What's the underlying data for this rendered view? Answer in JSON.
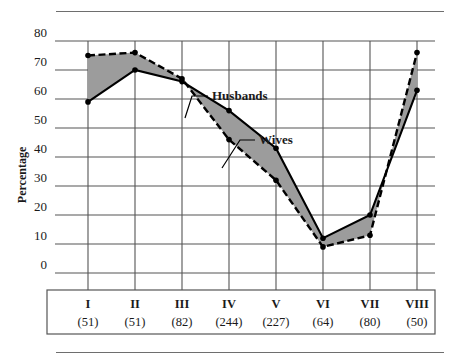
{
  "chart_data": {
    "type": "line",
    "title": "",
    "xlabel": "",
    "ylabel": "Percentage",
    "ylim": [
      0,
      80
    ],
    "ytick_step": 10,
    "yticks": [
      0,
      10,
      20,
      30,
      40,
      50,
      60,
      70,
      80
    ],
    "grid": true,
    "legend_position": "inline-annotations",
    "categories": [
      "I",
      "II",
      "III",
      "IV",
      "V",
      "VI",
      "VII",
      "VIII"
    ],
    "category_counts": [
      "(51)",
      "(51)",
      "(82)",
      "(244)",
      "(227)",
      "(64)",
      "(80)",
      "(50)"
    ],
    "series": [
      {
        "name": "Husbands",
        "style": "dashed",
        "values": [
          75,
          76,
          67,
          46,
          32,
          9,
          13,
          76
        ]
      },
      {
        "name": "Wives",
        "style": "solid",
        "values": [
          59,
          70,
          66,
          56,
          43,
          12,
          20,
          63
        ]
      }
    ],
    "band_fill": "#9c9c9c",
    "annotations": [
      {
        "text": "Husbands",
        "target_category": "III"
      },
      {
        "text": "Wives",
        "target_category": "IV"
      }
    ]
  },
  "axes": {
    "y_title": "Percentage",
    "y_tick_labels": [
      "80",
      "70",
      "60",
      "50",
      "40",
      "30",
      "20",
      "10",
      "0"
    ],
    "x_categories": [
      {
        "label": "I",
        "count": "(51)"
      },
      {
        "label": "II",
        "count": "(51)"
      },
      {
        "label": "III",
        "count": "(82)"
      },
      {
        "label": "IV",
        "count": "(244)"
      },
      {
        "label": "V",
        "count": "(227)"
      },
      {
        "label": "VI",
        "count": "(64)"
      },
      {
        "label": "VII",
        "count": "(80)"
      },
      {
        "label": "VIII",
        "count": "(50)"
      }
    ]
  },
  "annotations": {
    "husbands": "Husbands",
    "wives": "Wives"
  },
  "colors": {
    "band": "#9c9c9c",
    "line": "#000000",
    "grid": "#555555",
    "rule": "#6e6e6e"
  }
}
